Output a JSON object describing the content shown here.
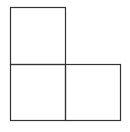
{
  "diagram": {
    "stroke_color": "#333333",
    "background_color": "#ffffff",
    "stroke_width": 1.2,
    "squares": [
      {
        "name": "top-left-square",
        "x": 10.5,
        "y": 7.5,
        "width": 55,
        "height": 57
      },
      {
        "name": "bottom-left-square",
        "x": 10.5,
        "y": 64.5,
        "width": 55,
        "height": 56
      },
      {
        "name": "bottom-right-square",
        "x": 65.5,
        "y": 64.5,
        "width": 55,
        "height": 56
      }
    ]
  }
}
